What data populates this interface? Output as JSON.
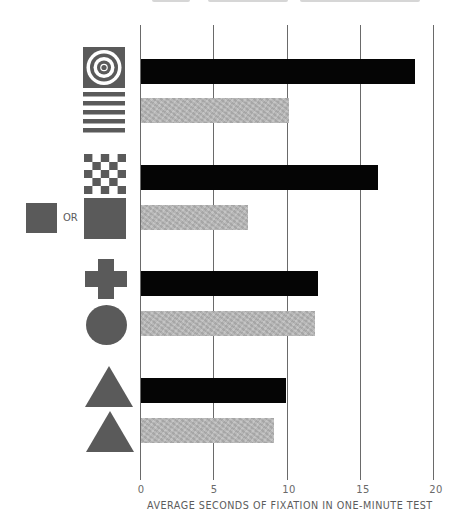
{
  "chart_data": {
    "type": "bar",
    "orientation": "horizontal",
    "title": "",
    "xlabel": "AVERAGE SECONDS OF FIXATION IN ONE-MINUTE TEST",
    "ylabel": "",
    "xlim": [
      0,
      20
    ],
    "xticks": [
      "0",
      "5",
      "10",
      "15",
      "20"
    ],
    "grid": true,
    "legend": null,
    "pairs": [
      {
        "pair": 1,
        "bars": [
          {
            "stimulus": "concentric-circles (bullseye)",
            "value": 18.7,
            "shade": "black"
          },
          {
            "stimulus": "horizontal-stripes",
            "value": 10.1,
            "shade": "gray"
          }
        ]
      },
      {
        "pair": 2,
        "bars": [
          {
            "stimulus": "checkerboard",
            "value": 16.2,
            "shade": "black"
          },
          {
            "stimulus": "plain square (small or large)",
            "value": 7.3,
            "shade": "gray"
          }
        ]
      },
      {
        "pair": 3,
        "bars": [
          {
            "stimulus": "cross",
            "value": 12.1,
            "shade": "black"
          },
          {
            "stimulus": "circle",
            "value": 11.9,
            "shade": "gray"
          }
        ]
      },
      {
        "pair": 4,
        "bars": [
          {
            "stimulus": "triangle",
            "value": 9.9,
            "shade": "black"
          },
          {
            "stimulus": "triangle",
            "value": 9.1,
            "shade": "gray"
          }
        ]
      }
    ],
    "categories": [
      "bullseye",
      "stripes",
      "checkerboard",
      "plain square",
      "cross",
      "circle",
      "triangle",
      "triangle"
    ],
    "values": [
      18.7,
      10.1,
      16.2,
      7.3,
      12.1,
      11.9,
      9.9,
      9.1
    ]
  },
  "labels": {
    "or": "OR",
    "tick_0": "0",
    "tick_5": "5",
    "tick_10": "10",
    "tick_15": "15",
    "tick_20": "20",
    "xlabel": "AVERAGE SECONDS OF FIXATION IN ONE-MINUTE TEST"
  },
  "colors": {
    "dark_bar": "#050505",
    "light_bar": "#b9b9b9",
    "icon_fill": "#5a5a5a",
    "grid": "#6a6a6a"
  }
}
